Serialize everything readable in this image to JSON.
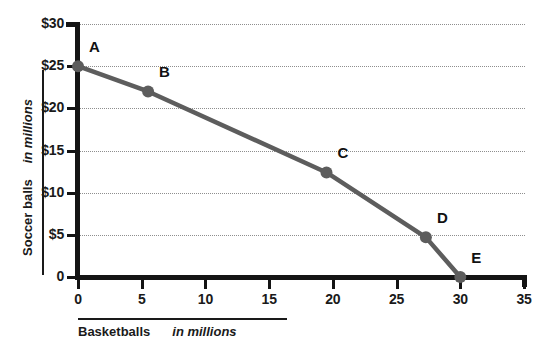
{
  "chart_data": {
    "type": "line",
    "title": "",
    "subtitle": "",
    "xlabel": "Basketballs",
    "xlabel_unit": "in millions",
    "ylabel": "Soccer balls",
    "ylabel_unit": "in millions",
    "xlim": [
      0,
      35
    ],
    "ylim": [
      0,
      30
    ],
    "xticks": [
      "0",
      "5",
      "10",
      "15",
      "20",
      "25",
      "30",
      "35"
    ],
    "xtick_values": [
      0,
      5,
      10,
      15,
      20,
      25,
      30,
      35
    ],
    "yticks": [
      "0",
      "$5",
      "$10",
      "$15",
      "$20",
      "$25",
      "$30"
    ],
    "ytick_values": [
      0,
      5,
      10,
      15,
      20,
      25,
      30
    ],
    "grid": "horizontal-dotted",
    "legend": "none",
    "series": [
      {
        "name": "Production possibilities frontier",
        "color": "#5d5d5d",
        "points": [
          {
            "label": "A",
            "x": 0,
            "y": 25.0
          },
          {
            "label": "B",
            "x": 5.5,
            "y": 22.0
          },
          {
            "label": "C",
            "x": 19.5,
            "y": 12.4
          },
          {
            "label": "D",
            "x": 27.3,
            "y": 4.7
          },
          {
            "label": "E",
            "x": 30.0,
            "y": 0.0
          }
        ]
      }
    ],
    "annotations": [
      {
        "text": "A",
        "x": 0,
        "y": 25.0
      },
      {
        "text": "B",
        "x": 5.5,
        "y": 22.0
      },
      {
        "text": "C",
        "x": 19.5,
        "y": 12.4
      },
      {
        "text": "D",
        "x": 27.3,
        "y": 4.7
      },
      {
        "text": "E",
        "x": 30.0,
        "y": 0.0
      }
    ]
  },
  "colors": {
    "line": "#5d5d5d",
    "marker": "#5d5d5d",
    "axis": "#141414",
    "grid": "#8e8e8e",
    "text": "#1a1a1a",
    "background": "#ffffff"
  }
}
